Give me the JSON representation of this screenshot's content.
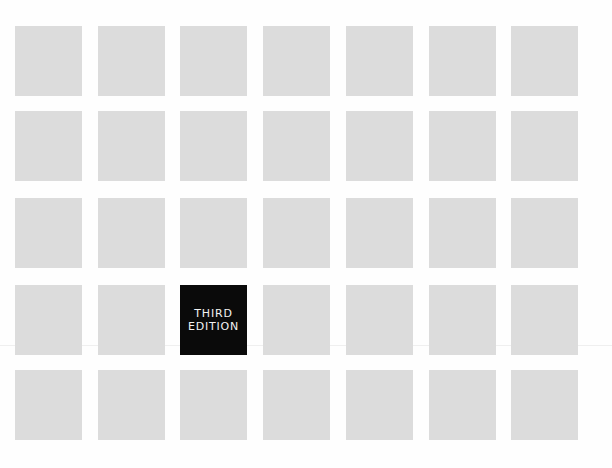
{
  "cover": {
    "grid": {
      "rows": 5,
      "columns": 7,
      "tile_color": "#dcdcdc",
      "highlight_color": "#0a0a0a",
      "highlight_text_color": "#f2f2f2",
      "col_lefts": [
        15,
        98,
        180,
        263,
        346,
        429,
        511
      ],
      "row_tops": [
        26,
        111,
        198,
        285,
        370
      ]
    },
    "badge": {
      "row": 3,
      "column": 2,
      "line1": "THIRD",
      "line2": "EDITION"
    }
  }
}
